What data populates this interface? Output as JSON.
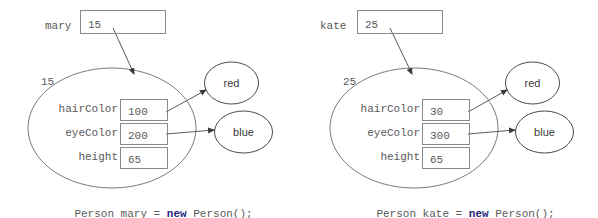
{
  "diagram": {
    "colors": {
      "stroke": "#7a7a7a",
      "text": "#595959",
      "keyword": "#1f1f7a"
    },
    "panels": [
      {
        "id": "mary",
        "variable_label": "mary",
        "variable_value": "15",
        "object_address": "15",
        "fields": [
          {
            "name": "hairColor",
            "value": "100"
          },
          {
            "name": "eyeColor",
            "value": "200"
          },
          {
            "name": "height",
            "value": "65"
          }
        ],
        "referenced_objects": [
          {
            "name": "red"
          },
          {
            "name": "blue"
          }
        ],
        "caption_before": "Person mary = ",
        "caption_keyword": "new",
        "caption_after": " Person();"
      },
      {
        "id": "kate",
        "variable_label": "kate",
        "variable_value": "25",
        "object_address": "25",
        "fields": [
          {
            "name": "hairColor",
            "value": "30"
          },
          {
            "name": "eyeColor",
            "value": "300"
          },
          {
            "name": "height",
            "value": "65"
          }
        ],
        "referenced_objects": [
          {
            "name": "red"
          },
          {
            "name": "blue"
          }
        ],
        "caption_before": "Person kate = ",
        "caption_keyword": "new",
        "caption_after": " Person();"
      }
    ]
  }
}
